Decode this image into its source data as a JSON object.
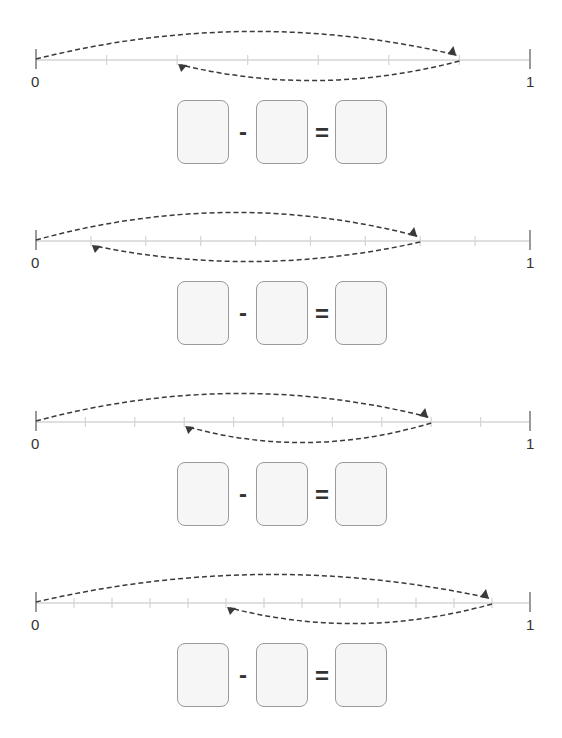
{
  "worksheet": {
    "problems": [
      {
        "id": 1,
        "line_y": 60,
        "divisions": 7,
        "start_label": "0",
        "end_label": "1",
        "forward_jump": {
          "from": 0,
          "to": 6
        },
        "backward_jump": {
          "from": 6,
          "to": 2
        },
        "equation": {
          "box1": "",
          "operator": "-",
          "box2": "",
          "equals": "=",
          "result": ""
        }
      },
      {
        "id": 2,
        "line_y": 241,
        "divisions": 9,
        "start_label": "0",
        "end_label": "1",
        "forward_jump": {
          "from": 0,
          "to": 7
        },
        "backward_jump": {
          "from": 7,
          "to": 1
        },
        "equation": {
          "box1": "",
          "operator": "-",
          "box2": "",
          "equals": "=",
          "result": ""
        }
      },
      {
        "id": 3,
        "line_y": 422,
        "divisions": 10,
        "start_label": "0",
        "end_label": "1",
        "forward_jump": {
          "from": 0,
          "to": 8
        },
        "backward_jump": {
          "from": 8,
          "to": 3
        },
        "equation": {
          "box1": "",
          "operator": "-",
          "box2": "",
          "equals": "=",
          "result": ""
        }
      },
      {
        "id": 4,
        "line_y": 603,
        "divisions": 13,
        "start_label": "0",
        "end_label": "1",
        "forward_jump": {
          "from": 0,
          "to": 12
        },
        "backward_jump": {
          "from": 12,
          "to": 5
        },
        "equation": {
          "box1": "",
          "operator": "-",
          "box2": "",
          "equals": "=",
          "result": ""
        }
      }
    ],
    "colors": {
      "axis": "#d4d4d4",
      "end_tick": "#9a9a9a",
      "arrow": "#3a3a3a",
      "box_border": "#9a9a9a",
      "box_fill": "#f6f6f6"
    }
  }
}
